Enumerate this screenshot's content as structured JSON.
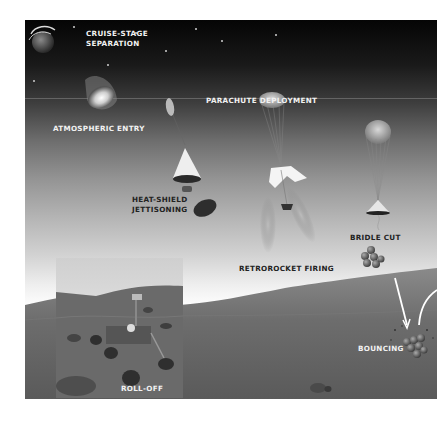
{
  "diagram": {
    "stages": [
      {
        "id": "cruise-stage-separation",
        "label_line1": "CRUISE-STAGE",
        "label_line2": "SEPARATION"
      },
      {
        "id": "atmospheric-entry",
        "label": "ATMOSPHERIC ENTRY"
      },
      {
        "id": "parachute-deployment",
        "label": "PARACHUTE DEPLOYMENT"
      },
      {
        "id": "heat-shield-jettisoning",
        "label_line1": "HEAT-SHIELD",
        "label_line2": "JETTISONING"
      },
      {
        "id": "retrorocket-firing",
        "label": "RETROROCKET FIRING"
      },
      {
        "id": "bridle-cut",
        "label": "BRIDLE CUT"
      },
      {
        "id": "bouncing",
        "label": "BOUNCING"
      },
      {
        "id": "roll-off",
        "label": "ROLL-OFF"
      }
    ]
  }
}
